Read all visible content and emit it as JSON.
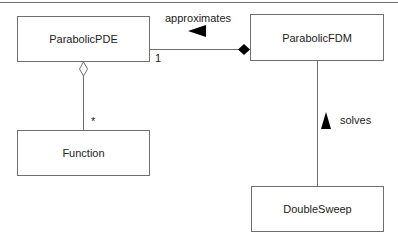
{
  "diagram": {
    "type": "UML class diagram",
    "classes": [
      {
        "id": "pde",
        "name": "ParabolicPDE"
      },
      {
        "id": "fdm",
        "name": "ParabolicFDM"
      },
      {
        "id": "func",
        "name": "Function"
      },
      {
        "id": "ds",
        "name": "DoubleSweep"
      }
    ],
    "relations": [
      {
        "from": "ParabolicFDM",
        "to": "ParabolicPDE",
        "kind": "composition",
        "label": "approximates",
        "multiplicity_pde_end": "1"
      },
      {
        "from": "ParabolicPDE",
        "to": "Function",
        "kind": "aggregation",
        "multiplicity_function_end": "*"
      },
      {
        "from": "DoubleSweep",
        "to": "ParabolicFDM",
        "kind": "association",
        "label": "solves"
      }
    ],
    "labels": {
      "approximates": "approximates",
      "solves": "solves",
      "mult_one": "1",
      "mult_many": "*"
    }
  }
}
